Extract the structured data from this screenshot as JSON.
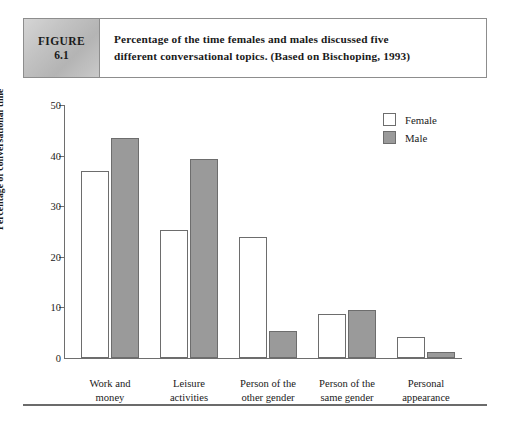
{
  "figure": {
    "tag_label": "FIGURE",
    "tag_number": "6.1",
    "caption_line1": "Percentage of the time females and males discussed five",
    "caption_line2": "different conversational topics. (Based on Bischoping, 1993)"
  },
  "colors": {
    "male_fill": "#9a9a9a",
    "female_fill": "#ffffff",
    "bar_stroke": "#6d6d6d",
    "axis": "#6e6e6e",
    "tag_background": "#c2c2c2"
  },
  "chart_data": {
    "type": "bar",
    "title": "Percentage of the time females and males discussed five different conversational topics. (Based on Bischoping, 1993)",
    "xlabel": "",
    "ylabel": "Percentage of conversational time",
    "ylim": [
      0,
      50
    ],
    "yticks": [
      0,
      10,
      20,
      30,
      40,
      50
    ],
    "ytick_labels": [
      "0",
      "10",
      "20",
      "30",
      "40",
      "50"
    ],
    "grid": false,
    "legend_position": "top-right",
    "categories": [
      "Work and money",
      "Leisure activities",
      "Person of the other gender",
      "Person of the same gender",
      "Personal appearance"
    ],
    "category_lines": [
      [
        "Work and",
        "money"
      ],
      [
        "Leisure",
        "activities"
      ],
      [
        "Person of the",
        "other gender"
      ],
      [
        "Person of the",
        "same gender"
      ],
      [
        "Personal",
        "appearance"
      ]
    ],
    "series": [
      {
        "name": "Female",
        "values": [
          37.0,
          25.3,
          24.0,
          8.7,
          4.1
        ]
      },
      {
        "name": "Male",
        "values": [
          43.5,
          39.4,
          5.3,
          9.5,
          1.1
        ]
      }
    ]
  },
  "legend": {
    "items": [
      {
        "label": "Female",
        "swatch": "white-square"
      },
      {
        "label": "Male",
        "swatch": "gray-square"
      }
    ]
  }
}
